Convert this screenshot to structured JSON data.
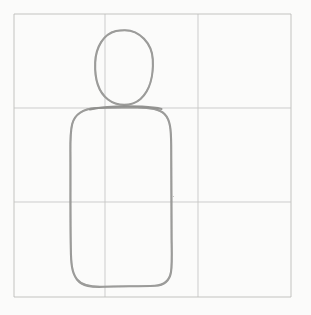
{
  "document": {
    "kind": "hand-drawn pencil sketch",
    "title": "Figure study on 3x3 grid",
    "width": 311,
    "height": 315,
    "paper_color": "#fdfdfc",
    "pencil_color": "#8f8f8d",
    "grid_color": "#b8b8b6"
  },
  "grid": {
    "name": "proportion-grid",
    "rows": 3,
    "columns": 3,
    "left": 14,
    "top": 14,
    "right": 291,
    "bottom": 297,
    "vertical_lines": [
      14,
      105,
      198,
      291
    ],
    "horizontal_lines": [
      14,
      108,
      202,
      297
    ],
    "stroke_color": "#b8b8b6"
  },
  "figure": {
    "name": "human-figure-sketch",
    "parts": [
      {
        "name": "head-circle",
        "label": "Head",
        "shape": "circle",
        "center_x": 124,
        "center_y": 68,
        "radius_x": 29,
        "radius_y": 38,
        "bounds": {
          "left": 95,
          "top": 30,
          "right": 153,
          "bottom": 106
        }
      },
      {
        "name": "torso-rounded-rect",
        "label": "Torso",
        "shape": "rounded-rectangle",
        "bounds": {
          "left": 70,
          "top": 107,
          "right": 172,
          "bottom": 287
        },
        "corner_radius_top": 26,
        "corner_radius_bottom": 22
      }
    ]
  },
  "strokes": {
    "head_path": "M124.5,30.2 C139.5,30.0 152.0,43.5 152.8,59.5 C153.6,75.0 150.0,90.5 140.5,99.0 C131.5,107.0 117.0,106.5 108.0,99.5 C98.0,91.8 94.6,77.5 95.2,62.5 C95.8,47.0 103.5,34.0 116.0,31.0 C118.8,30.4 121.6,30.2 124.5,30.2 Z",
    "torso_path": "M96.0,108.0 C84.5,108.8 75.0,113.5 72.2,124.0 C70.4,131.0 70.3,141.5 70.4,152.0 C70.6,180.0 70.2,215.0 70.8,248.0 C71.0,262.0 71.5,272.5 77.0,279.5 C82.5,286.4 92.0,287.2 103.0,286.8 C120.0,286.0 140.0,286.6 155.0,285.8 C164.0,285.3 169.5,281.0 171.0,272.0 C172.2,264.5 171.8,252.0 171.6,240.0 C171.2,210.0 171.6,175.0 171.2,145.0 C171.0,130.0 170.5,120.0 164.5,114.0 C158.5,108.0 147.0,107.2 135.0,107.4 C122.0,107.6 108.0,107.4 96.0,108.0 Z",
    "shoulder_accent_path": "M90.0,109.5 C105.0,106.4 125.0,105.8 142.0,106.6 C150.0,107.0 157.0,107.8 161.5,109.0"
  },
  "accessibility": {
    "alt_text": "A light pencil drawing of a simple human figure — a circular head above a tall rounded-rectangle torso — sketched over a three-by-three guideline grid on white paper."
  }
}
